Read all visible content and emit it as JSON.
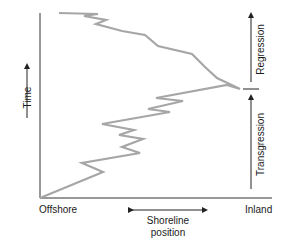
{
  "diagram": {
    "type": "shoreline-trajectory",
    "y_axis": {
      "label": "Time",
      "direction": "up"
    },
    "x_axis": {
      "left_label": "Offshore",
      "right_label": "Inland",
      "center_label_line1": "Shoreline",
      "center_label_line2": "position",
      "arrow": "bidirectional"
    },
    "phases": [
      {
        "name": "Transgression",
        "label": "Transgression",
        "position": "lower"
      },
      {
        "name": "Regression",
        "label": "Regression",
        "position": "upper"
      }
    ],
    "trajectory": {
      "color": "#a6a6a6",
      "description": "Jagged line moving inland (right) with time during transgression, peaking at maximum inland position, then moving offshore (left) during regression",
      "points": [
        [
          40,
          198
        ],
        [
          103,
          172
        ],
        [
          82,
          163
        ],
        [
          140,
          153
        ],
        [
          122,
          147
        ],
        [
          143,
          139
        ],
        [
          119,
          135
        ],
        [
          134,
          130
        ],
        [
          102,
          124
        ],
        [
          170,
          112
        ],
        [
          148,
          109
        ],
        [
          183,
          101
        ],
        [
          156,
          98
        ],
        [
          227,
          85
        ],
        [
          240,
          89
        ],
        [
          217,
          78
        ],
        [
          205,
          67
        ],
        [
          192,
          54
        ],
        [
          158,
          46
        ],
        [
          145,
          35
        ],
        [
          122,
          31
        ],
        [
          96,
          24
        ],
        [
          106,
          20
        ],
        [
          84,
          16
        ],
        [
          98,
          14
        ],
        [
          59,
          13
        ]
      ]
    },
    "colors": {
      "axis": "#333333",
      "trajectory": "#a6a6a6",
      "text": "#1a1a1a"
    }
  }
}
